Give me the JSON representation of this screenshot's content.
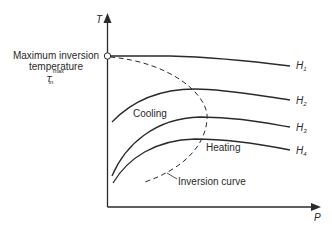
{
  "diagram": {
    "type": "thermodynamic T-P diagram (Joule-Thomson isenthalps)",
    "axes": {
      "y_label": "T",
      "x_label": "P"
    },
    "annotations": {
      "max_inversion_line1": "Maximum inversion",
      "max_inversion_line2": "temperature",
      "symbol_base": "T",
      "symbol_sup": "max",
      "symbol_sub": "in",
      "cooling": "Cooling",
      "heating": "Heating",
      "inversion_curve": "Inversion curve"
    },
    "curves": [
      {
        "name": "H",
        "sub": "1"
      },
      {
        "name": "H",
        "sub": "2"
      },
      {
        "name": "H",
        "sub": "3"
      },
      {
        "name": "H",
        "sub": "4"
      }
    ],
    "colors": {
      "line": "#2a2a2a",
      "background": "#ffffff"
    }
  }
}
